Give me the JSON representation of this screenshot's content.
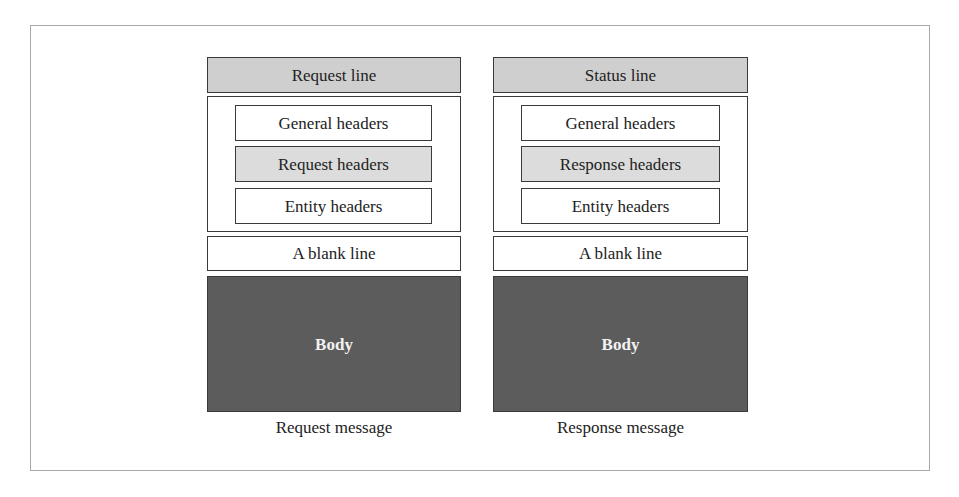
{
  "diagram": {
    "colors": {
      "line_fill": "#cfcfcf",
      "specific_header_fill": "#dcdcdc",
      "body_fill": "#5c5c5c",
      "border": "#3a3a3a",
      "frame": "#a9a9a9"
    },
    "request": {
      "top_line": "Request line",
      "headers": [
        "General headers",
        "Request headers",
        "Entity headers"
      ],
      "blank_line": "A blank line",
      "body": "Body",
      "caption": "Request message"
    },
    "response": {
      "top_line": "Status line",
      "headers": [
        "General headers",
        "Response headers",
        "Entity headers"
      ],
      "blank_line": "A blank line",
      "body": "Body",
      "caption": "Response message"
    }
  }
}
